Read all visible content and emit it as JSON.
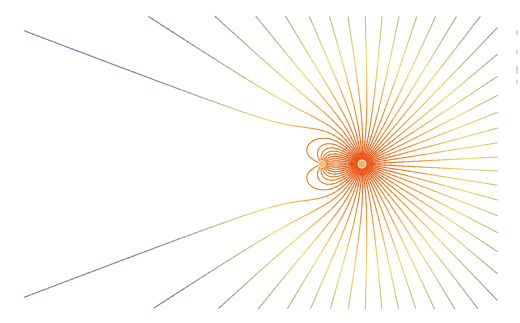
{
  "figure": {
    "title": "",
    "width": 520,
    "height": 323,
    "background": "#ffffff",
    "bounds": {
      "x0": 25,
      "y0": 17,
      "x1": 497,
      "y1": 308
    },
    "charges": [
      {
        "name": "strong-charge",
        "x": 362,
        "y": 164,
        "q": 1.0,
        "radius": 4,
        "color": "#f7b267"
      },
      {
        "name": "weak-charge",
        "x": 322,
        "y": 164,
        "q": -0.18,
        "radius": 3.5,
        "color": "#f7c07a"
      }
    ],
    "line_count": 64,
    "line_width": 1.1,
    "colormap": {
      "near": "#e8440e",
      "mid_orange": "#f08c2a",
      "mid": "#f0dc6a",
      "far": "#6a7fa8"
    },
    "edge_marks": [
      {
        "x": 516,
        "y": 30,
        "h": 5
      },
      {
        "x": 516,
        "y": 50,
        "h": 4
      },
      {
        "x": 516,
        "y": 66,
        "h": 8
      },
      {
        "x": 516,
        "y": 80,
        "h": 4
      }
    ]
  }
}
